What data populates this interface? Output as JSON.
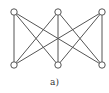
{
  "diagram": {
    "type": "bipartite-graph",
    "name": "K3,3",
    "caption": "a)",
    "nodes": [
      {
        "id": "t1",
        "x": 14,
        "y": 12
      },
      {
        "id": "t2",
        "x": 58,
        "y": 12
      },
      {
        "id": "t3",
        "x": 102,
        "y": 12
      },
      {
        "id": "b1",
        "x": 14,
        "y": 65
      },
      {
        "id": "b2",
        "x": 58,
        "y": 65
      },
      {
        "id": "b3",
        "x": 102,
        "y": 65
      }
    ],
    "edges": [
      [
        "t1",
        "b1"
      ],
      [
        "t1",
        "b2"
      ],
      [
        "t1",
        "b3"
      ],
      [
        "t2",
        "b1"
      ],
      [
        "t2",
        "b2"
      ],
      [
        "t2",
        "b3"
      ],
      [
        "t3",
        "b1"
      ],
      [
        "t3",
        "b2"
      ],
      [
        "t3",
        "b3"
      ]
    ],
    "colors": {
      "stroke": "#555555",
      "node_fill": "#ffffff"
    }
  }
}
